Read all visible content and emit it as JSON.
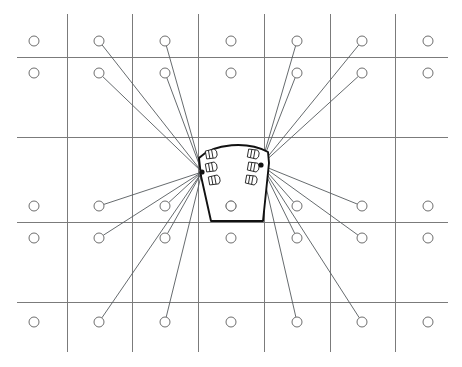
{
  "figure": {
    "kind": "technical-line-drawing",
    "canvas": {
      "width": 462,
      "height": 367,
      "background": "#ffffff"
    },
    "stroke_colors": {
      "grid": "#7b7b7b",
      "ray": "#555a5e",
      "node": "#6e6e6e",
      "stage": "#111111",
      "marker": "#1a1a1a"
    }
  },
  "grid": {
    "vertical_lines_x": [
      67,
      132,
      198,
      264,
      330,
      395
    ],
    "vertical_span_y": [
      14,
      352
    ],
    "horizontal_lines_y": [
      57,
      137,
      222,
      302
    ],
    "horizontal_span_x": [
      17,
      448
    ],
    "columns": 7,
    "rows": 6
  },
  "nodes": {
    "radius": 5,
    "columns_x": [
      34,
      99,
      165,
      231,
      297,
      362,
      428
    ],
    "rows_y": [
      41,
      73,
      206,
      238,
      322
    ],
    "positions": [
      {
        "x": 34,
        "y": 41
      },
      {
        "x": 99,
        "y": 41
      },
      {
        "x": 165,
        "y": 41
      },
      {
        "x": 231,
        "y": 41
      },
      {
        "x": 297,
        "y": 41
      },
      {
        "x": 362,
        "y": 41
      },
      {
        "x": 428,
        "y": 41
      },
      {
        "x": 34,
        "y": 73
      },
      {
        "x": 99,
        "y": 73
      },
      {
        "x": 165,
        "y": 73
      },
      {
        "x": 231,
        "y": 73
      },
      {
        "x": 297,
        "y": 73
      },
      {
        "x": 362,
        "y": 73
      },
      {
        "x": 428,
        "y": 73
      },
      {
        "x": 34,
        "y": 206
      },
      {
        "x": 99,
        "y": 206
      },
      {
        "x": 165,
        "y": 206
      },
      {
        "x": 231,
        "y": 206
      },
      {
        "x": 297,
        "y": 206
      },
      {
        "x": 362,
        "y": 206
      },
      {
        "x": 428,
        "y": 206
      },
      {
        "x": 34,
        "y": 238
      },
      {
        "x": 99,
        "y": 238
      },
      {
        "x": 165,
        "y": 238
      },
      {
        "x": 231,
        "y": 238
      },
      {
        "x": 297,
        "y": 238
      },
      {
        "x": 362,
        "y": 238
      },
      {
        "x": 428,
        "y": 238
      },
      {
        "x": 34,
        "y": 322
      },
      {
        "x": 99,
        "y": 322
      },
      {
        "x": 165,
        "y": 322
      },
      {
        "x": 231,
        "y": 322
      },
      {
        "x": 297,
        "y": 322
      },
      {
        "x": 362,
        "y": 322
      },
      {
        "x": 428,
        "y": 322
      }
    ]
  },
  "origins": {
    "left": {
      "x": 202,
      "y": 172
    },
    "right": {
      "x": 261,
      "y": 165
    }
  },
  "rays": {
    "left_origin_targets": [
      {
        "x": 99,
        "y": 41
      },
      {
        "x": 165,
        "y": 41
      },
      {
        "x": 99,
        "y": 73
      },
      {
        "x": 165,
        "y": 73
      },
      {
        "x": 99,
        "y": 206
      },
      {
        "x": 165,
        "y": 206
      },
      {
        "x": 99,
        "y": 238
      },
      {
        "x": 165,
        "y": 238
      },
      {
        "x": 99,
        "y": 322
      },
      {
        "x": 165,
        "y": 322
      }
    ],
    "right_origin_targets": [
      {
        "x": 297,
        "y": 41
      },
      {
        "x": 362,
        "y": 41
      },
      {
        "x": 297,
        "y": 73
      },
      {
        "x": 362,
        "y": 73
      },
      {
        "x": 297,
        "y": 206
      },
      {
        "x": 362,
        "y": 206
      },
      {
        "x": 297,
        "y": 238
      },
      {
        "x": 362,
        "y": 238
      },
      {
        "x": 297,
        "y": 322
      },
      {
        "x": 362,
        "y": 322
      }
    ],
    "total_count": 20
  },
  "stage": {
    "shape": "trapezoid-with-arched-top",
    "outline_path": "M 199 158 C 214 143 248 141 268 152 L 269 163 L 263 221 L 211 221 L 201 176 Z",
    "top_arc": "M 199 158 C 214 143 248 141 268 152",
    "left_edge": "M 199 158 L 201 176 L 211 221",
    "right_edge": "M 268 152 L 269 163 L 263 221",
    "bottom_edge": "M 211 221 L 263 221",
    "center_node": {
      "x": 231,
      "y": 206,
      "radius": 5
    }
  },
  "markers": {
    "description": "small flag-shaped speaker markers flanking each origin point",
    "left_cluster": [
      {
        "x": 206,
        "y": 155,
        "rotate": -10
      },
      {
        "x": 206,
        "y": 168,
        "rotate": -10
      },
      {
        "x": 209,
        "y": 181,
        "rotate": -10
      }
    ],
    "right_cluster": [
      {
        "x": 248,
        "y": 153,
        "rotate": 10
      },
      {
        "x": 248,
        "y": 166,
        "rotate": 10
      },
      {
        "x": 246,
        "y": 179,
        "rotate": 10
      }
    ],
    "glyph_size": {
      "width": 13,
      "height": 9
    }
  }
}
